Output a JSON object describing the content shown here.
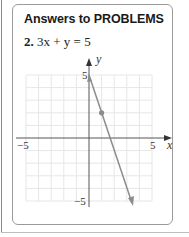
{
  "header": {
    "title": "Answers to PROBLEMS"
  },
  "problem": {
    "number": "2.",
    "equation": "3x + y = 5"
  },
  "graph": {
    "x_axis_label": "x",
    "y_axis_label": "y",
    "tick_labels": {
      "x_min": "−5",
      "x_max": "5",
      "y_max": "5",
      "y_min": "−5"
    },
    "line_color": "#8c8c8c",
    "grid_color": "#e6e6e6",
    "points": [
      {
        "x": 0,
        "y": 5
      },
      {
        "x": 1,
        "y": 2
      }
    ]
  }
}
